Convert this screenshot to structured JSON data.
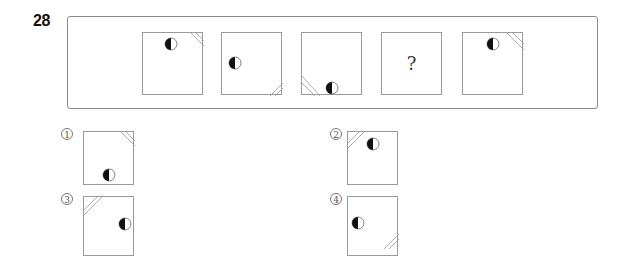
{
  "question": {
    "number": "28",
    "sequence": [
      {
        "label": "figure-1",
        "circle": {
          "cx": 28,
          "cy": 11
        },
        "corner": "top-right"
      },
      {
        "label": "figure-2",
        "circle": {
          "cx": 13,
          "cy": 30
        },
        "corner": "bottom-right"
      },
      {
        "label": "figure-3",
        "circle": {
          "cx": 30,
          "cy": 55
        },
        "corner": "bottom-left"
      },
      {
        "label": "figure-4",
        "unknown": "?"
      },
      {
        "label": "figure-5",
        "circle": {
          "cx": 30,
          "cy": 11
        },
        "corner": "top-right"
      }
    ]
  },
  "options": [
    {
      "marker": "1",
      "circle": {
        "cx": 25,
        "cy": 43
      },
      "corner": "top-right"
    },
    {
      "marker": "2",
      "circle": {
        "cx": 25,
        "cy": 12
      },
      "corner": "top-left"
    },
    {
      "marker": "3",
      "circle": {
        "cx": 41,
        "cy": 27
      },
      "corner": "top-left"
    },
    {
      "marker": "4",
      "circle": {
        "cx": 10,
        "cy": 26
      },
      "corner": "bottom-right"
    }
  ],
  "colors": {
    "stroke": "#9a9a9a",
    "fill_dark": "#111111"
  }
}
